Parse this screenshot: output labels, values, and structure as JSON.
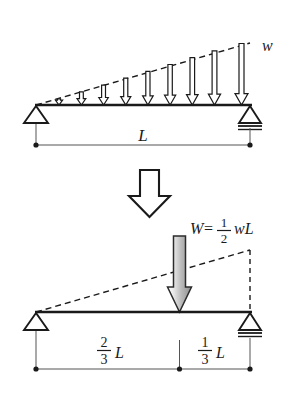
{
  "figure": {
    "background_color": "#ffffff",
    "line_color": "#1a1a1a",
    "dimension_color": "#555555",
    "resultant_fill_light": "#f2f2f2",
    "resultant_fill_dark": "#9a9a9a"
  },
  "top_figure": {
    "name": "distributed-load-beam",
    "load_label": "w",
    "span_label": "L",
    "load_arrow_count": 9,
    "left_support_type": "pin",
    "right_support_type": "roller",
    "beam_y": 105,
    "beam_left_x": 36,
    "beam_right_x": 250
  },
  "transition": {
    "name": "equivalence-arrow",
    "glyph": "block-down-arrow"
  },
  "bottom_figure": {
    "name": "resultant-load-beam",
    "resultant_label": {
      "lhs": "W",
      "equals": "=",
      "numerator": "1",
      "denominator": "2",
      "trailing": "wL"
    },
    "left_dimension": {
      "numerator": "2",
      "denominator": "3",
      "symbol": "L"
    },
    "right_dimension": {
      "numerator": "1",
      "denominator": "3",
      "symbol": "L"
    },
    "left_support_type": "pin",
    "right_support_type": "roller",
    "beam_y": 312,
    "beam_left_x": 36,
    "beam_right_x": 250,
    "resultant_x": 179
  }
}
